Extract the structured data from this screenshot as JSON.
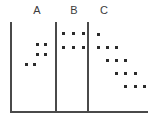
{
  "figure": {
    "title": "",
    "background_color": "#ffffff",
    "axis_color": "#4a4a4a",
    "dot_color": "#2b2b2b",
    "label_color": "#3c3c3c",
    "width": 159,
    "height": 136
  },
  "labels": [
    {
      "text": "A",
      "x": 30,
      "y": 5
    },
    {
      "text": "B",
      "x": 67,
      "y": 5
    },
    {
      "text": "C",
      "x": 97,
      "y": 5
    }
  ],
  "dividers": [
    {
      "name": "divider-left",
      "x": 10,
      "y": 22,
      "height": 91
    },
    {
      "name": "divider-middle",
      "x": 55,
      "y": 22,
      "height": 91
    },
    {
      "name": "divider-right",
      "x": 87,
      "y": 22,
      "height": 91
    }
  ],
  "baseline": {
    "name": "baseline-axis",
    "x": 10,
    "y": 111,
    "width": 138
  },
  "chart_data": {
    "type": "scatter",
    "title": "",
    "xlabel": "",
    "ylabel": "",
    "grid": false,
    "legend": "none",
    "note": "Dot plot: three groups A, B, C separated by vertical rules on a common horizontal baseline. Group A has 3 rows of 2 dots stepping down-left; group B has 2 rows of 3 dots; group C has 5 rows forming a down-right staircase.",
    "categories": [
      "A",
      "B",
      "C"
    ],
    "counts": [
      6,
      6,
      13
    ],
    "groups": [
      {
        "name": "A",
        "dot_count": 6,
        "rows": [
          {
            "row": 1,
            "y": 43,
            "dots_x": [
              36,
              44
            ]
          },
          {
            "row": 2,
            "y": 53,
            "dots_x": [
              36,
              44
            ]
          },
          {
            "row": 3,
            "y": 63,
            "dots_x": [
              25,
              33
            ]
          }
        ]
      },
      {
        "name": "B",
        "dot_count": 6,
        "rows": [
          {
            "row": 1,
            "y": 32,
            "dots_x": [
              62,
              72,
              82
            ]
          },
          {
            "row": 2,
            "y": 46,
            "dots_x": [
              62,
              72,
              82
            ]
          }
        ]
      },
      {
        "name": "C",
        "dot_count": 13,
        "rows": [
          {
            "row": 1,
            "y": 33,
            "dots_x": [
              97
            ]
          },
          {
            "row": 2,
            "y": 46,
            "dots_x": [
              97,
              106,
              115
            ]
          },
          {
            "row": 3,
            "y": 59,
            "dots_x": [
              106,
              115,
              124
            ]
          },
          {
            "row": 4,
            "y": 72,
            "dots_x": [
              115,
              124,
              134
            ]
          },
          {
            "row": 5,
            "y": 85,
            "dots_x": [
              124,
              134,
              143
            ]
          }
        ]
      }
    ]
  }
}
